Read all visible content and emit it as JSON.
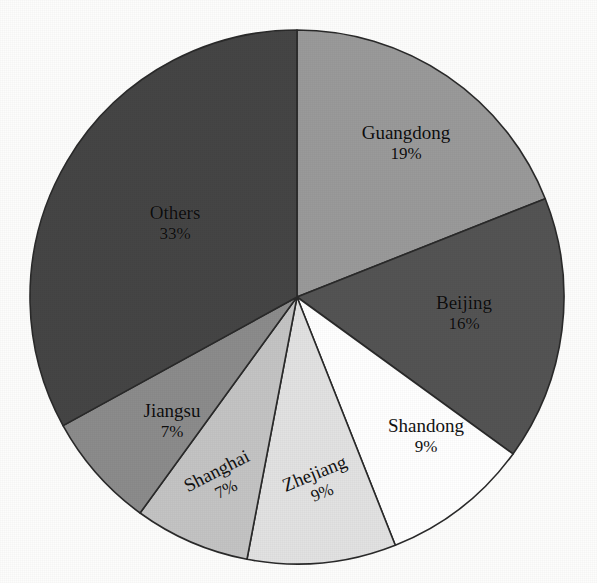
{
  "figure": {
    "title": "",
    "title_note": "cut-off text at top edge of scan"
  },
  "chart_data": {
    "type": "pie",
    "title": "",
    "xlabel": "",
    "ylabel": "",
    "legend_position": "none",
    "labels_on_slices": true,
    "start_angle_deg": 0,
    "direction": "clockwise",
    "center": {
      "x": 297,
      "y": 297
    },
    "radius": 267,
    "categories": [
      "Guangdong",
      "Beijing",
      "Shandong",
      "Zhejiang",
      "Shanghai",
      "Jiangsu",
      "Others"
    ],
    "values": [
      19,
      16,
      9,
      9,
      7,
      7,
      33
    ],
    "units": "percent",
    "slices": [
      {
        "name": "Guangdong",
        "value": 19,
        "value_text": "19%",
        "color": "#9a9a9a",
        "start_deg": 0.0,
        "end_deg": 68.4,
        "label_rotation": 0
      },
      {
        "name": "Beijing",
        "value": 16,
        "value_text": "16%",
        "color": "#545454",
        "start_deg": 68.4,
        "end_deg": 126.0,
        "label_rotation": 0
      },
      {
        "name": "Shandong",
        "value": 9,
        "value_text": "9%",
        "color": "#ffffff",
        "start_deg": 126.0,
        "end_deg": 158.4,
        "label_rotation": 0
      },
      {
        "name": "Zhejiang",
        "value": 9,
        "value_text": "9%",
        "color": "#e2e2e2",
        "start_deg": 158.4,
        "end_deg": 190.8,
        "label_rotation": -22
      },
      {
        "name": "Shanghai",
        "value": 7,
        "value_text": "7%",
        "color": "#c4c4c4",
        "start_deg": 190.8,
        "end_deg": 216.0,
        "label_rotation": -27
      },
      {
        "name": "Jiangsu",
        "value": 7,
        "value_text": "7%",
        "color": "#8c8c8c",
        "start_deg": 216.0,
        "end_deg": 241.2,
        "label_rotation": 0
      },
      {
        "name": "Others",
        "value": 33,
        "value_text": "33%",
        "color": "#454545",
        "start_deg": 241.2,
        "end_deg": 360.0,
        "label_rotation": 0
      }
    ],
    "outline_color": "#2a2a2a"
  },
  "labels": {
    "guangdong": {
      "name": "Guangdong",
      "value": "19%"
    },
    "beijing": {
      "name": "Beijing",
      "value": "16%"
    },
    "shandong": {
      "name": "Shandong",
      "value": "9%"
    },
    "zhejiang": {
      "name": "Zhejiang",
      "value": "9%"
    },
    "shanghai": {
      "name": "Shanghai",
      "value": "7%"
    },
    "jiangsu": {
      "name": "Jiangsu",
      "value": "7%"
    },
    "others": {
      "name": "Others",
      "value": "33%"
    }
  }
}
